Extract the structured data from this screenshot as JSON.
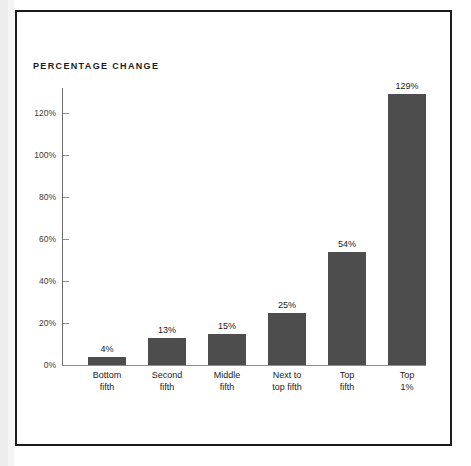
{
  "figure": {
    "title": "PERCENTAGE CHANGE",
    "frame_color": "#1b1b1b",
    "background": "#ffffff"
  },
  "chart_data": {
    "type": "bar",
    "title": "PERCENTAGE CHANGE",
    "xlabel": "",
    "ylabel": "",
    "categories": [
      "Bottom\nfifth",
      "Second\nfifth",
      "Middle\nfifth",
      "Next to\ntop fifth",
      "Top\nfifth",
      "Top\n1%"
    ],
    "values": [
      4,
      13,
      15,
      25,
      54,
      129
    ],
    "value_labels": [
      "4%",
      "13%",
      "15%",
      "25%",
      "54%",
      "129%"
    ],
    "ylim": [
      0,
      130
    ],
    "ytick_values": [
      0,
      20,
      40,
      60,
      80,
      100,
      120
    ],
    "ytick_labels": [
      "0%",
      "20%",
      "40%",
      "60%",
      "80%",
      "100%",
      "120%"
    ],
    "grid": false,
    "legend": null,
    "bar_color": "#4d4d4d",
    "axis_color": "#8c8c8c"
  }
}
